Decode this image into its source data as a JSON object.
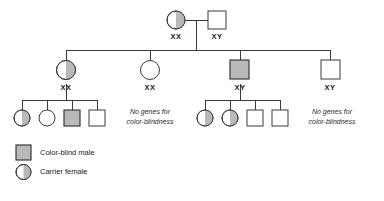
{
  "figure": {
    "type": "pedigree-chart",
    "colors": {
      "line": "#3a3a3a",
      "shade": "#b9b9b9",
      "text": "#1a1a1a",
      "background": "#ffffff"
    }
  },
  "generations": [
    {
      "id": "generation-1",
      "individuals": [
        {
          "id": "g1-mother",
          "shape": "circle",
          "sex": "female",
          "status": "carrier-female",
          "fill": "half-right",
          "genotype": "XX"
        },
        {
          "id": "g1-father",
          "shape": "square",
          "sex": "male",
          "status": "normal-male",
          "fill": "none",
          "genotype": "XY"
        }
      ]
    },
    {
      "id": "generation-2",
      "individuals": [
        {
          "id": "g2-child-1",
          "shape": "circle",
          "sex": "female",
          "status": "carrier-female",
          "fill": "half-right",
          "genotype": "XX"
        },
        {
          "id": "g2-child-2",
          "shape": "circle",
          "sex": "female",
          "status": "normal-female",
          "fill": "none",
          "genotype": "XX"
        },
        {
          "id": "g2-child-3",
          "shape": "square",
          "sex": "male",
          "status": "color-blind-male",
          "fill": "solid",
          "genotype": "XY"
        },
        {
          "id": "g2-child-4",
          "shape": "square",
          "sex": "male",
          "status": "normal-male",
          "fill": "none",
          "genotype": "XY"
        }
      ]
    },
    {
      "id": "generation-3-left",
      "parent": "g2-child-1",
      "individuals": [
        {
          "id": "g3l-child-1",
          "shape": "circle",
          "sex": "female",
          "status": "carrier-female",
          "fill": "half-right",
          "genotype": ""
        },
        {
          "id": "g3l-child-2",
          "shape": "circle",
          "sex": "female",
          "status": "normal-female",
          "fill": "none",
          "genotype": ""
        },
        {
          "id": "g3l-child-3",
          "shape": "square",
          "sex": "male",
          "status": "color-blind-male",
          "fill": "solid",
          "genotype": ""
        },
        {
          "id": "g3l-child-4",
          "shape": "square",
          "sex": "male",
          "status": "normal-male",
          "fill": "none",
          "genotype": ""
        }
      ]
    },
    {
      "id": "generation-3-right",
      "parent": "g2-child-3",
      "individuals": [
        {
          "id": "g3r-child-1",
          "shape": "circle",
          "sex": "female",
          "status": "carrier-female",
          "fill": "half-right",
          "genotype": ""
        },
        {
          "id": "g3r-child-2",
          "shape": "circle",
          "sex": "female",
          "status": "carrier-female",
          "fill": "half-right",
          "genotype": ""
        },
        {
          "id": "g3r-child-3",
          "shape": "square",
          "sex": "male",
          "status": "normal-male",
          "fill": "none",
          "genotype": ""
        },
        {
          "id": "g3r-child-4",
          "shape": "square",
          "sex": "male",
          "status": "normal-male",
          "fill": "none",
          "genotype": ""
        }
      ]
    }
  ],
  "genotype_labels": {
    "g1_mother": "XX",
    "g1_father": "XY",
    "g2_child_1": "XX",
    "g2_child_2": "XX",
    "g2_child_3": "XY",
    "g2_child_4": "XY"
  },
  "annotations": [
    {
      "id": "note-under-g2-child-2",
      "line1": "No genes for",
      "line2": "color-blindness"
    },
    {
      "id": "note-under-g2-child-4",
      "line1": "No genes for",
      "line2": "color-blindness"
    }
  ],
  "legend": {
    "items": [
      {
        "id": "legend-color-blind-male",
        "symbol": "square-solid",
        "label": "Color-blind male"
      },
      {
        "id": "legend-carrier-female",
        "symbol": "circle-half",
        "label": "Carrier female"
      }
    ]
  }
}
